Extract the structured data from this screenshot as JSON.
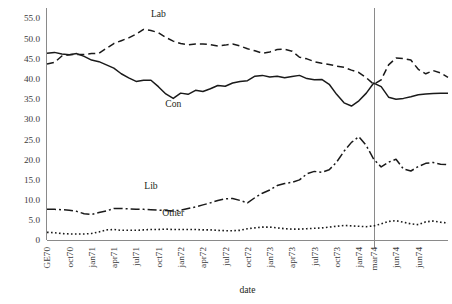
{
  "chart_data": {
    "type": "line",
    "title": "",
    "xlabel": "date",
    "ylabel": "",
    "ylim": [
      0,
      57.5
    ],
    "yticks": [
      0,
      5,
      10,
      15,
      20,
      25,
      30,
      35,
      40,
      45,
      50,
      55
    ],
    "ytick_labels": [
      "0",
      "5.0",
      "10.0",
      "15.0",
      "20.0",
      "25.0",
      "30.0",
      "35.0",
      "40.0",
      "45.0",
      "50.0",
      "55.0"
    ],
    "grid": false,
    "legend_position": "inline-annotations",
    "x_tick_labels": [
      "GE70",
      "oct70",
      "jan71",
      "apr71",
      "jul71",
      "oct71",
      "jan72",
      "apr72",
      "jul72",
      "oct72",
      "jan73",
      "apr73",
      "jul73",
      "oct73",
      "jan74",
      "mar74",
      "jun74",
      "jun74"
    ],
    "x_index_of_ticks": [
      0,
      3,
      6,
      9,
      12,
      15,
      18,
      21,
      24,
      27,
      30,
      33,
      36,
      39,
      42,
      44,
      47,
      50
    ],
    "n_points": 52,
    "annotations": [
      {
        "text": "Lab",
        "x_index": 15,
        "y_value": 55.2
      },
      {
        "text": "Con",
        "x_index": 17,
        "y_value": 33.0
      },
      {
        "text": "Lib",
        "x_index": 14,
        "y_value": 12.6
      },
      {
        "text": "Other",
        "x_index": 17,
        "y_value": 6.0
      }
    ],
    "reference_line": {
      "x_index": 44,
      "label": "mar74"
    },
    "series": [
      {
        "name": "Lab",
        "style": "dashed",
        "dash": "7,4",
        "width": 1.5,
        "values": [
          43.6,
          44.0,
          45.6,
          45.9,
          46.0,
          46.0,
          46.2,
          46.3,
          47.5,
          48.7,
          49.4,
          50.1,
          51.0,
          52.2,
          51.9,
          51.4,
          50.2,
          49.3,
          48.7,
          48.4,
          48.6,
          48.6,
          48.4,
          48.1,
          48.3,
          48.6,
          48.1,
          47.4,
          46.9,
          46.3,
          46.6,
          47.2,
          47.3,
          46.8,
          45.3,
          44.9,
          44.2,
          43.8,
          43.5,
          43.1,
          42.8,
          42.1,
          41.5,
          40.2,
          38.6,
          39.7,
          43.4,
          45.1,
          45.0,
          44.6,
          42.3,
          41.2,
          42.0,
          41.4,
          40.3
        ],
        "values_note": "percent vote intention"
      },
      {
        "name": "Con",
        "style": "solid",
        "dash": "none",
        "width": 1.5,
        "values": [
          46.3,
          46.5,
          46.1,
          45.9,
          46.2,
          45.5,
          44.6,
          44.2,
          43.4,
          42.6,
          41.2,
          40.2,
          39.3,
          39.6,
          39.6,
          38.0,
          36.2,
          35.1,
          36.4,
          36.1,
          37.1,
          36.8,
          37.5,
          38.3,
          38.1,
          38.9,
          39.3,
          39.5,
          40.6,
          40.8,
          40.4,
          40.6,
          40.2,
          40.5,
          40.8,
          40.0,
          39.7,
          39.8,
          38.6,
          36.1,
          34.0,
          33.2,
          34.5,
          36.4,
          38.9,
          38.0,
          35.4,
          34.9,
          35.1,
          35.5,
          36.0,
          36.2,
          36.3,
          36.4,
          36.4
        ]
      },
      {
        "name": "Lib",
        "style": "dash-dot",
        "dash": "9,3,2,3",
        "width": 1.5,
        "values": [
          7.6,
          7.6,
          7.5,
          7.4,
          7.1,
          6.5,
          6.3,
          6.8,
          7.2,
          7.8,
          7.8,
          7.7,
          7.6,
          7.6,
          7.5,
          7.4,
          7.3,
          7.2,
          7.4,
          7.8,
          8.2,
          8.7,
          9.2,
          9.8,
          10.2,
          10.3,
          9.8,
          9.2,
          10.5,
          11.6,
          12.4,
          13.5,
          14.0,
          14.3,
          14.9,
          16.4,
          17.0,
          16.8,
          17.4,
          19.3,
          22.0,
          24.2,
          25.6,
          23.4,
          20.0,
          18.1,
          19.3,
          20.0,
          17.6,
          17.1,
          18.2,
          19.0,
          19.2,
          18.8,
          18.7
        ]
      },
      {
        "name": "Other",
        "style": "dotted",
        "dash": "1.6,2.4",
        "width": 1.6,
        "values": [
          1.9,
          1.8,
          1.6,
          1.5,
          1.5,
          1.5,
          1.6,
          2.0,
          2.5,
          2.6,
          2.4,
          2.4,
          2.4,
          2.5,
          2.6,
          2.6,
          2.7,
          2.6,
          2.6,
          2.6,
          2.6,
          2.5,
          2.5,
          2.4,
          2.3,
          2.3,
          2.4,
          2.8,
          3.0,
          3.2,
          3.2,
          3.0,
          2.8,
          2.7,
          2.7,
          2.8,
          2.9,
          3.0,
          3.2,
          3.4,
          3.6,
          3.5,
          3.4,
          3.3,
          3.5,
          4.0,
          4.6,
          4.8,
          4.4,
          4.0,
          3.8,
          4.5,
          4.7,
          4.4,
          4.2
        ]
      }
    ]
  }
}
